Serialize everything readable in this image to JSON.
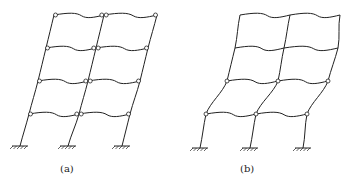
{
  "figures": [
    {
      "id": "a",
      "label": "(a)",
      "description": "Two-bay four-storey frame under lateral sway with plastic hinges at beam ends (beam-sway mechanism)",
      "hinge_location": "beam ends at every floor",
      "floors": [
        {
          "y": 15,
          "nodes": [
            54,
            104,
            157
          ]
        },
        {
          "y": 48,
          "nodes": [
            46,
            96,
            148
          ]
        },
        {
          "y": 81,
          "nodes": [
            38,
            88,
            140
          ]
        },
        {
          "y": 114,
          "nodes": [
            29,
            79,
            130
          ]
        }
      ],
      "supports": [
        {
          "x": 20,
          "y": 146
        },
        {
          "x": 68,
          "y": 146
        },
        {
          "x": 122,
          "y": 146
        }
      ]
    },
    {
      "id": "b",
      "label": "(b)",
      "description": "Two-bay four-storey frame with plastic hinges concentrated in lower storeys (storey/column-sway mechanism)",
      "hinge_location": "column ends at first two floors",
      "floors": [
        {
          "y": 15,
          "nodes": [
            240,
            290,
            340
          ],
          "hinged": false
        },
        {
          "y": 48,
          "nodes": [
            235,
            284,
            338
          ],
          "hinged": false
        },
        {
          "y": 81,
          "nodes": [
            227,
            278,
            328
          ],
          "hinged": true
        },
        {
          "y": 114,
          "nodes": [
            206,
            256,
            307
          ],
          "hinged": true
        }
      ],
      "supports": [
        {
          "x": 200,
          "y": 148
        },
        {
          "x": 250,
          "y": 148
        },
        {
          "x": 303,
          "y": 148
        }
      ]
    }
  ],
  "colors": {
    "line": "#222222",
    "background": "#ffffff"
  }
}
